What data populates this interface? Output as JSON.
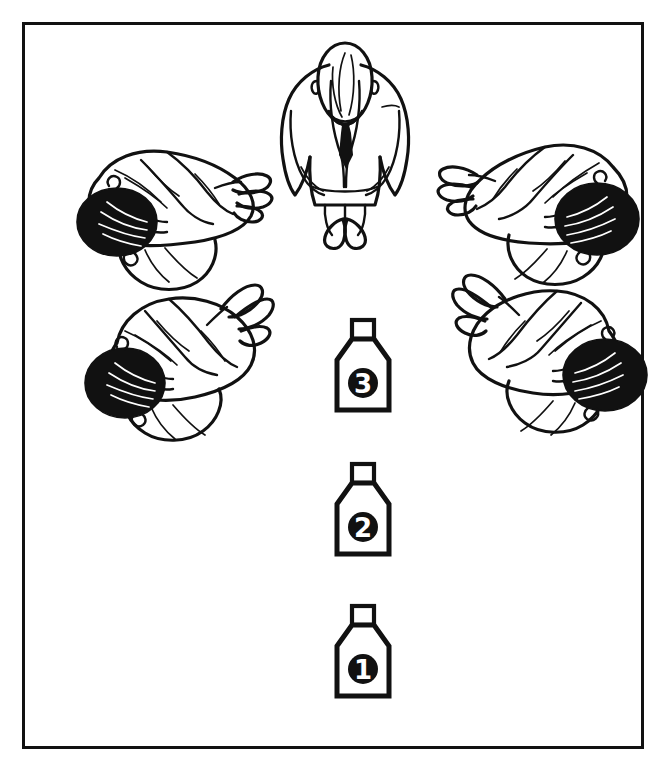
{
  "diagram": {
    "background_color": "#ffffff",
    "ink_color": "#111111",
    "frame": {
      "border_color": "#111111",
      "border_width_px": 3,
      "x": 22,
      "y": 22,
      "width": 622,
      "height": 727
    },
    "figures": [
      {
        "id": "standing-figure",
        "label": "standing person in suit, viewed from above",
        "pose": "standing",
        "hair": "bald",
        "attire": "suit with necktie",
        "position": "top-center",
        "x": 288,
        "y": 45,
        "width": 120,
        "height": 175
      },
      {
        "id": "bowing-figure-top-left",
        "label": "bowing person viewed from above, head toward lower-left",
        "pose": "bowing",
        "hair": "dark",
        "position": "upper-left",
        "x": 62,
        "y": 135,
        "width": 200,
        "height": 155
      },
      {
        "id": "bowing-figure-top-right",
        "label": "bowing person viewed from above, head toward lower-right",
        "pose": "bowing",
        "hair": "dark",
        "position": "upper-right",
        "x": 418,
        "y": 122,
        "width": 205,
        "height": 160
      },
      {
        "id": "bowing-figure-bottom-left",
        "label": "bowing person viewed from above, head toward lower-left",
        "pose": "bowing",
        "hair": "dark",
        "position": "lower-left",
        "x": 78,
        "y": 278,
        "width": 190,
        "height": 160
      },
      {
        "id": "bowing-figure-bottom-right",
        "label": "bowing person viewed from above, head toward lower-right",
        "pose": "bowing",
        "hair": "dark",
        "position": "lower-right",
        "x": 415,
        "y": 265,
        "width": 200,
        "height": 170
      }
    ],
    "containers": [
      {
        "id": "container-3",
        "number": "3",
        "label": "numbered container 3",
        "x": 328,
        "y": 318,
        "width": 66,
        "height": 98
      },
      {
        "id": "container-2",
        "number": "2",
        "label": "numbered container 2",
        "x": 328,
        "y": 462,
        "width": 66,
        "height": 98
      },
      {
        "id": "container-1",
        "number": "1",
        "label": "numbered container 1",
        "x": 328,
        "y": 604,
        "width": 66,
        "height": 98
      }
    ]
  }
}
